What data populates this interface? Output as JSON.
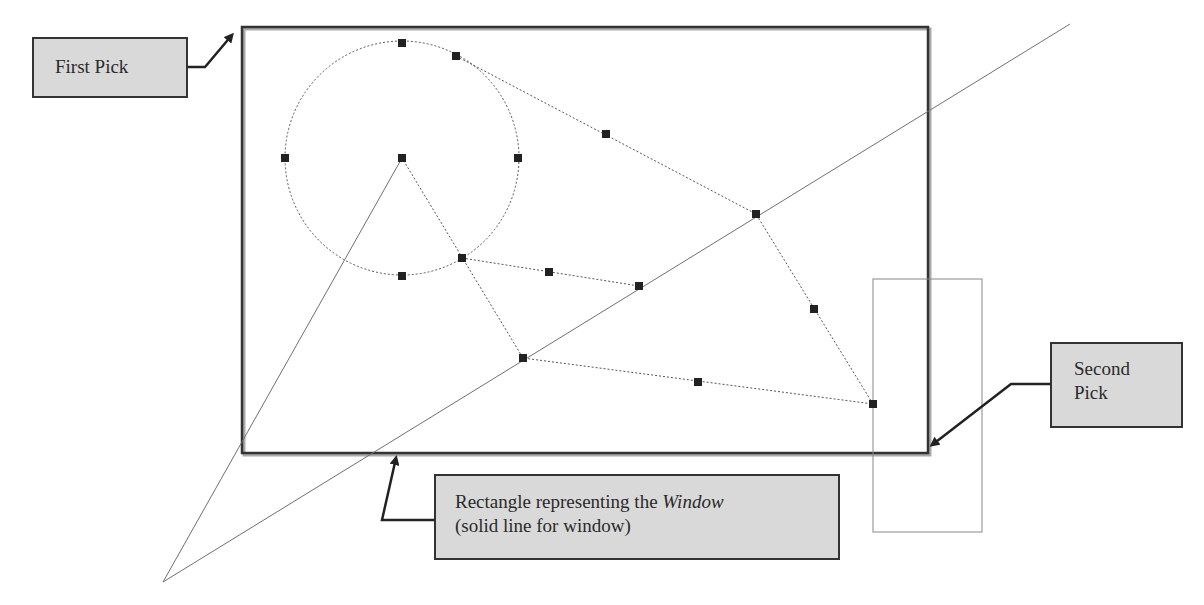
{
  "callouts": {
    "first_pick": "First Pick",
    "second_pick_line1": "Second",
    "second_pick_line2": "Pick",
    "window_label_prefix": "Rectangle representing the ",
    "window_label_italic": "Window",
    "window_label_line2": "(solid line for window)"
  },
  "geometry": {
    "window_rect": {
      "x": 242,
      "y": 27,
      "w": 686,
      "h": 426
    },
    "crossing_rect": {
      "x": 873,
      "y": 279,
      "w": 109,
      "h": 253
    },
    "circle": {
      "cx": 402,
      "cy": 158,
      "r": 117
    },
    "grips": [
      [
        402,
        43
      ],
      [
        456,
        56
      ],
      [
        285,
        158
      ],
      [
        402,
        158
      ],
      [
        518,
        158
      ],
      [
        402,
        276
      ],
      [
        606,
        134
      ],
      [
        756,
        214
      ],
      [
        462,
        258
      ],
      [
        549,
        272
      ],
      [
        639,
        286
      ],
      [
        814,
        309
      ],
      [
        523,
        358
      ],
      [
        698,
        382
      ],
      [
        873,
        404
      ]
    ],
    "solid_lines": [
      [
        [
          163,
          582
        ],
        [
          1070,
          24
        ]
      ],
      [
        [
          163,
          582
        ],
        [
          402,
          158
        ]
      ]
    ],
    "dashed_polylines": [
      [
        [
          456,
          56
        ],
        [
          756,
          214
        ],
        [
          873,
          404
        ],
        [
          523,
          358
        ],
        [
          402,
          158
        ]
      ],
      [
        [
          462,
          258
        ],
        [
          639,
          286
        ]
      ]
    ]
  },
  "colors": {
    "callout_fill": "#d9d9d9",
    "callout_border": "#333333",
    "line": "#707070",
    "grip": "#222222",
    "window_border": "#333333"
  }
}
